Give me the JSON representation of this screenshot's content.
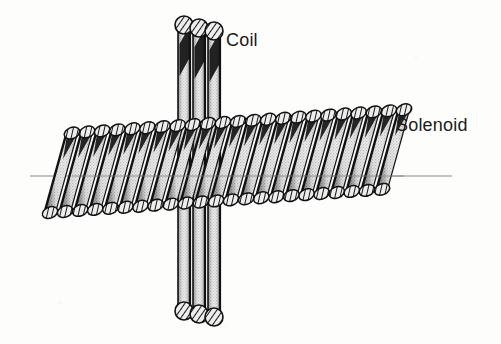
{
  "figure": {
    "background_color": "#fdfdfc",
    "ink_color": "#111111",
    "axis": {
      "name": "solenoid-axis",
      "color": "#8a8a8a",
      "x_start": 30,
      "x_end": 452,
      "y": 176,
      "stroke_width": 1
    },
    "labels": [
      {
        "id": "coil",
        "text": "Coil",
        "x": 226,
        "y": 30,
        "font_size": 18
      },
      {
        "id": "solenoid",
        "text": "Solenoid",
        "x": 396,
        "y": 115,
        "font_size": 18
      }
    ],
    "solenoid": {
      "name": "solenoid-winding",
      "turns": 23,
      "x_start": 72,
      "x_end": 404,
      "top_y": 133,
      "bottom_y": 211,
      "slant_dx": 22,
      "wire_width": 11,
      "cap_rx": 8,
      "cap_ry": 5.5,
      "tilt_deg": -4,
      "fill": "#d9d9d9",
      "edge": "#111111"
    },
    "coil": {
      "name": "central-coil",
      "strands": 3,
      "top_y": 24,
      "bottom_y": 318,
      "center_x": 199,
      "strand_width": 12,
      "strand_gap": 15,
      "cap_r": 9,
      "fill": "#dedede",
      "edge": "#111111"
    }
  }
}
